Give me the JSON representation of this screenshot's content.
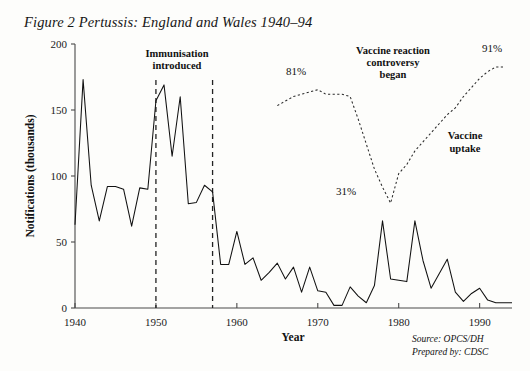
{
  "figure": {
    "title": "Figure 2 Pertussis: England and Wales 1940–94",
    "source_line_1": "Source: OPCS/DH",
    "source_line_2": "Prepared by: CDSC"
  },
  "annotations": {
    "immunisation": {
      "line1": "Immunisation",
      "line2": "introduced",
      "year": 1950
    },
    "controversy": {
      "line1": "Vaccine reaction",
      "line2": "controversy",
      "line3": "began",
      "year": 1974
    },
    "uptake_label": {
      "line1": "Vaccine",
      "line2": "uptake"
    },
    "pct_peak": "81%",
    "pct_trough": "31%",
    "pct_final": "91%"
  },
  "chart_data": {
    "type": "line",
    "title": "Figure 2 Pertussis: England and Wales 1940–94",
    "xlabel": "Year",
    "ylabel": "Notifications (thousands)",
    "xlim": [
      1940,
      1994
    ],
    "ylim": [
      0,
      200
    ],
    "yticks": [
      0,
      50,
      100,
      150,
      200
    ],
    "xticks": [
      1940,
      1950,
      1960,
      1970,
      1980,
      1990
    ],
    "grid": false,
    "legend": "none",
    "vertical_markers": [
      {
        "year": 1950,
        "label": "Immunisation introduced",
        "style": "dashed"
      },
      {
        "year": 1957,
        "label": "",
        "style": "dashed"
      }
    ],
    "series": [
      {
        "name": "Notifications (thousands)",
        "style": "solid",
        "axis": "left",
        "x": [
          1940,
          1941,
          1942,
          1943,
          1944,
          1945,
          1946,
          1947,
          1948,
          1949,
          1950,
          1951,
          1952,
          1953,
          1954,
          1955,
          1956,
          1957,
          1958,
          1959,
          1960,
          1961,
          1962,
          1963,
          1964,
          1965,
          1966,
          1967,
          1968,
          1969,
          1970,
          1971,
          1972,
          1973,
          1974,
          1975,
          1976,
          1977,
          1978,
          1979,
          1980,
          1981,
          1982,
          1983,
          1984,
          1985,
          1986,
          1987,
          1988,
          1989,
          1990,
          1991,
          1992,
          1993,
          1994
        ],
        "values": [
          63,
          173,
          93,
          66,
          92,
          92,
          90,
          62,
          91,
          90,
          157,
          169,
          115,
          160,
          79,
          80,
          93,
          88,
          33,
          33,
          58,
          33,
          38,
          21,
          27,
          34,
          22,
          31,
          12,
          31,
          13,
          12,
          2,
          2,
          16,
          9,
          4,
          17,
          66,
          22,
          21,
          20,
          66,
          36,
          15,
          26,
          37,
          12,
          5,
          11,
          15,
          6,
          4,
          4,
          4
        ]
      },
      {
        "name": "Vaccine uptake (%)",
        "style": "dashed",
        "axis": "right_percent",
        "x": [
          1965,
          1966,
          1967,
          1968,
          1969,
          1970,
          1971,
          1972,
          1973,
          1974,
          1975,
          1976,
          1977,
          1978,
          1979,
          1980,
          1981,
          1982,
          1983,
          1984,
          1985,
          1986,
          1987,
          1988,
          1989,
          1990,
          1991,
          1992,
          1993
        ],
        "values": [
          74,
          76,
          78,
          79,
          80,
          81,
          79,
          79,
          79,
          78,
          68,
          57,
          46,
          38,
          31,
          44,
          48,
          54,
          58,
          62,
          66,
          70,
          73,
          78,
          82,
          86,
          89,
          91,
          91
        ]
      }
    ]
  }
}
